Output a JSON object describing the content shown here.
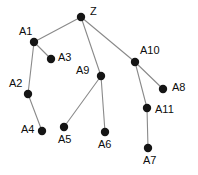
{
  "figure": {
    "name": "node-link-graph",
    "background_color": "#ffffff",
    "node_color": "#151515",
    "edge_color": "#8a8a8a",
    "label_color": "#0d0d0d",
    "width": 198,
    "height": 175
  },
  "graph": {
    "type": "node-link-diagram",
    "directed": false,
    "root": "Z",
    "node_count": 12,
    "edge_count": 11,
    "nodes": [
      {
        "id": "Z",
        "label": "Z",
        "x": 81,
        "y": 17,
        "r": 4.2,
        "label_x": 90,
        "label_y": 6
      },
      {
        "id": "A1",
        "label": "A1",
        "x": 34,
        "y": 42,
        "r": 4.2,
        "label_x": 19,
        "label_y": 26
      },
      {
        "id": "A3",
        "label": "A3",
        "x": 51,
        "y": 59,
        "r": 4.2,
        "label_x": 58,
        "label_y": 52
      },
      {
        "id": "A2",
        "label": "A2",
        "x": 28,
        "y": 94,
        "r": 4.2,
        "label_x": 9,
        "label_y": 78
      },
      {
        "id": "A4",
        "label": "A4",
        "x": 42,
        "y": 131,
        "r": 4.2,
        "label_x": 21,
        "label_y": 124
      },
      {
        "id": "A9",
        "label": "A9",
        "x": 101,
        "y": 76,
        "r": 4.2,
        "label_x": 76,
        "label_y": 65
      },
      {
        "id": "A5",
        "label": "A5",
        "x": 64,
        "y": 127,
        "r": 4.2,
        "label_x": 58,
        "label_y": 134
      },
      {
        "id": "A6",
        "label": "A6",
        "x": 105,
        "y": 132,
        "r": 4.2,
        "label_x": 98,
        "label_y": 139
      },
      {
        "id": "A10",
        "label": "A10",
        "x": 135,
        "y": 62,
        "r": 4.2,
        "label_x": 140,
        "label_y": 45
      },
      {
        "id": "A8",
        "label": "A8",
        "x": 163,
        "y": 89,
        "r": 4.2,
        "label_x": 172,
        "label_y": 82
      },
      {
        "id": "A11",
        "label": "A11",
        "x": 147,
        "y": 108,
        "r": 4.2,
        "label_x": 155,
        "label_y": 104
      },
      {
        "id": "A7",
        "label": "A7",
        "x": 148,
        "y": 148,
        "r": 4.2,
        "label_x": 143,
        "label_y": 155
      }
    ],
    "edges": [
      {
        "source": "Z",
        "target": "A1"
      },
      {
        "source": "Z",
        "target": "A9"
      },
      {
        "source": "Z",
        "target": "A10"
      },
      {
        "source": "A1",
        "target": "A3"
      },
      {
        "source": "A1",
        "target": "A2"
      },
      {
        "source": "A2",
        "target": "A4"
      },
      {
        "source": "A9",
        "target": "A5"
      },
      {
        "source": "A9",
        "target": "A6"
      },
      {
        "source": "A10",
        "target": "A8"
      },
      {
        "source": "A10",
        "target": "A11"
      },
      {
        "source": "A11",
        "target": "A7"
      }
    ]
  }
}
